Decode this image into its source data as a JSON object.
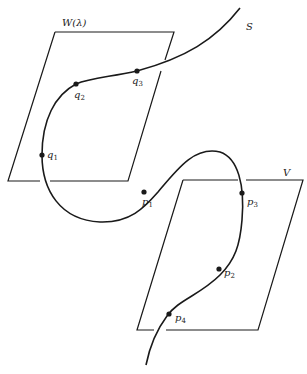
{
  "figure": {
    "planes": [
      {
        "id": "W",
        "label": "W(λ)"
      },
      {
        "id": "V",
        "label": "V"
      }
    ],
    "curve": {
      "label": "S"
    },
    "points": {
      "q1": {
        "base": "q",
        "sub": "1"
      },
      "q2": {
        "base": "q",
        "sub": "2"
      },
      "q3": {
        "base": "q",
        "sub": "3"
      },
      "p1": {
        "base": "p",
        "sub": "1"
      },
      "p2": {
        "base": "p",
        "sub": "2"
      },
      "p3": {
        "base": "p",
        "sub": "3"
      },
      "p4": {
        "base": "p",
        "sub": "4"
      }
    },
    "colors": {
      "ink": "#1a1a1a",
      "background": "#ffffff"
    }
  }
}
